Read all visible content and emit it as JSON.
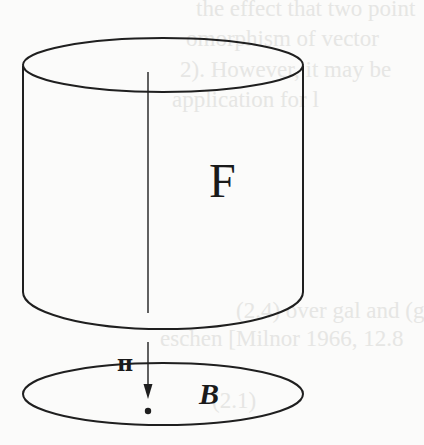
{
  "figure": {
    "total_space_label": "F",
    "projection_label": "π",
    "base_space_label": "B"
  },
  "ghost_text": [
    "the effect that two point",
    "omorphism of vector",
    "2). However, it may be",
    "application for l",
    "(2.4) over gal and (g",
    "eschen [Milnor 1966, 12.8",
    "(2.1)"
  ],
  "colors": {
    "stroke": "#1f1f1f",
    "background": "#fbfbfa",
    "ghost_text": "#e6e6e4"
  }
}
